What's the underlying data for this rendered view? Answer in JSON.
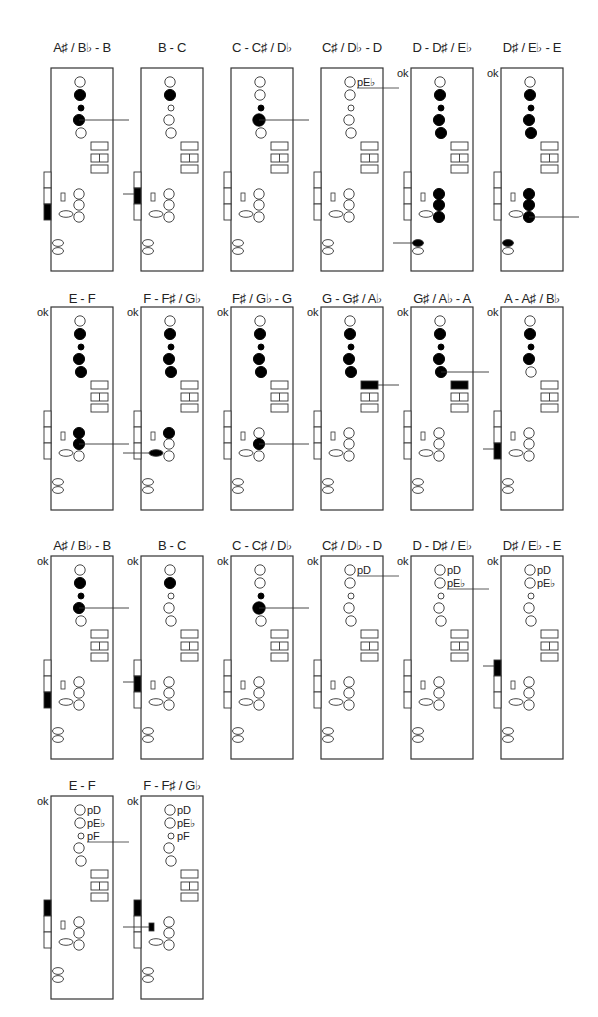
{
  "figure": {
    "ok_label": "ok",
    "rows": [
      {
        "title_y": 40,
        "box_y": 68
      },
      {
        "title_y": 291,
        "box_y": 307
      },
      {
        "title_y": 538,
        "box_y": 556
      },
      {
        "title_y": 778,
        "box_y": 796
      }
    ],
    "columns_x": [
      51,
      141,
      231,
      321,
      411,
      501
    ],
    "panels": [
      {
        "row": 0,
        "col": 0,
        "title": "A♯ / B♭ - B",
        "ok": false,
        "upper": [
          "open",
          "filled",
          "filled-small",
          "filled",
          "open"
        ],
        "upper_line": 3,
        "pads": [
          "open",
          "split",
          "open"
        ],
        "pad_line": -1,
        "side": [
          "open",
          "open",
          "filled"
        ],
        "side_line": -1,
        "lower": [
          "open",
          "open",
          "open"
        ],
        "lower_line": -1,
        "small_key": "open",
        "oval": "open",
        "bottom": [
          "open",
          "open"
        ],
        "bottom_line": -1,
        "labels": []
      },
      {
        "row": 0,
        "col": 1,
        "title": "B - C",
        "ok": false,
        "upper": [
          "open",
          "filled",
          "open-small",
          "open",
          "open"
        ],
        "upper_line": -1,
        "pads": [
          "open",
          "split",
          "open"
        ],
        "pad_line": -1,
        "side": [
          "open",
          "filled",
          "open"
        ],
        "side_line": 1,
        "lower": [
          "open",
          "open",
          "open"
        ],
        "lower_line": -1,
        "small_key": "open",
        "oval": "open",
        "bottom": [
          "open",
          "open"
        ],
        "bottom_line": -1,
        "labels": []
      },
      {
        "row": 0,
        "col": 2,
        "title": "C - C♯ / D♭",
        "ok": false,
        "upper": [
          "open",
          "open",
          "filled-small",
          "filled-big",
          "open"
        ],
        "upper_line": 3,
        "pads": [
          "open",
          "split",
          "open"
        ],
        "pad_line": -1,
        "side": [
          "open",
          "open",
          "open"
        ],
        "side_line": -1,
        "lower": [
          "open",
          "open",
          "open"
        ],
        "lower_line": -1,
        "small_key": "open",
        "oval": "open",
        "bottom": [
          "open",
          "open"
        ],
        "bottom_line": -1,
        "labels": []
      },
      {
        "row": 0,
        "col": 3,
        "title": "C♯ / D♭ - D",
        "ok": false,
        "upper": [
          "open",
          "open",
          "open-small",
          "open",
          "open"
        ],
        "upper_line": -1,
        "pads": [
          "open",
          "split",
          "open"
        ],
        "pad_line": -1,
        "side": [
          "open",
          "open",
          "open"
        ],
        "side_line": -1,
        "lower": [
          "open",
          "open",
          "open"
        ],
        "lower_line": -1,
        "small_key": "open",
        "oval": "open",
        "bottom": [
          "open",
          "open"
        ],
        "bottom_line": -1,
        "labels": [
          {
            "text": "pE♭",
            "hole": 0,
            "line": true
          }
        ]
      },
      {
        "row": 0,
        "col": 4,
        "title": "D - D♯ / E♭",
        "ok": true,
        "upper": [
          "open",
          "filled",
          "filled-small",
          "filled",
          "filled"
        ],
        "upper_line": -1,
        "pads": [
          "open",
          "split",
          "open"
        ],
        "pad_line": -1,
        "side": [
          "open",
          "open",
          "open"
        ],
        "side_line": -1,
        "lower": [
          "filled",
          "filled",
          "filled"
        ],
        "lower_line": -1,
        "small_key": "open",
        "oval": "open",
        "bottom": [
          "filled",
          "open"
        ],
        "bottom_line": 0,
        "labels": []
      },
      {
        "row": 0,
        "col": 5,
        "title": "D♯ / E♭ - E",
        "ok": true,
        "upper": [
          "open",
          "filled",
          "filled-small",
          "filled",
          "filled"
        ],
        "upper_line": -1,
        "pads": [
          "open",
          "split",
          "open"
        ],
        "pad_line": -1,
        "side": [
          "open",
          "open",
          "open"
        ],
        "side_line": -1,
        "lower": [
          "filled",
          "filled",
          "filled"
        ],
        "lower_line": 2,
        "small_key": "open",
        "oval": "open",
        "bottom": [
          "filled",
          "open"
        ],
        "bottom_line": -1,
        "labels": []
      },
      {
        "row": 1,
        "col": 0,
        "title": "E - F",
        "ok": true,
        "upper": [
          "open",
          "filled",
          "filled-small",
          "filled",
          "filled"
        ],
        "upper_line": -1,
        "pads": [
          "open",
          "split",
          "open"
        ],
        "pad_line": -1,
        "side": [
          "open",
          "open",
          "open"
        ],
        "side_line": -1,
        "lower": [
          "filled",
          "filled",
          "open"
        ],
        "lower_line": 1,
        "small_key": "open",
        "oval": "open",
        "bottom": [
          "open",
          "open"
        ],
        "bottom_line": -1,
        "labels": []
      },
      {
        "row": 1,
        "col": 1,
        "title": "F - F♯ / G♭",
        "ok": true,
        "upper": [
          "open",
          "filled",
          "filled-small",
          "filled",
          "filled"
        ],
        "upper_line": -1,
        "pads": [
          "open",
          "split",
          "open"
        ],
        "pad_line": -1,
        "side": [
          "open",
          "open",
          "open"
        ],
        "side_line": -1,
        "lower": [
          "filled",
          "open",
          "open"
        ],
        "lower_line": -1,
        "small_key": "open",
        "oval": "filled",
        "oval_line": true,
        "bottom": [
          "open",
          "open"
        ],
        "bottom_line": -1,
        "labels": []
      },
      {
        "row": 1,
        "col": 2,
        "title": "F♯ / G♭ - G",
        "ok": true,
        "upper": [
          "open",
          "filled",
          "filled-small",
          "filled",
          "filled"
        ],
        "upper_line": -1,
        "pads": [
          "open",
          "split",
          "open"
        ],
        "pad_line": -1,
        "side": [
          "open",
          "open",
          "open"
        ],
        "side_line": -1,
        "lower": [
          "open",
          "filled",
          "open"
        ],
        "lower_line": 1,
        "small_key": "open",
        "oval": "open",
        "bottom": [
          "open",
          "open"
        ],
        "bottom_line": -1,
        "labels": []
      },
      {
        "row": 1,
        "col": 3,
        "title": "G - G♯ / A♭",
        "ok": true,
        "upper": [
          "open",
          "filled",
          "filled-small",
          "filled",
          "filled"
        ],
        "upper_line": -1,
        "pads": [
          "filled",
          "split",
          "open"
        ],
        "pad_line": 0,
        "side": [
          "open",
          "open",
          "open"
        ],
        "side_line": -1,
        "lower": [
          "open",
          "open",
          "open"
        ],
        "lower_line": -1,
        "small_key": "open",
        "oval": "open",
        "bottom": [
          "open",
          "open"
        ],
        "bottom_line": -1,
        "labels": []
      },
      {
        "row": 1,
        "col": 4,
        "title": "G♯ / A♭ - A",
        "ok": true,
        "upper": [
          "open",
          "filled",
          "filled-small",
          "filled",
          "filled"
        ],
        "upper_line": 4,
        "pads": [
          "filled",
          "split",
          "open"
        ],
        "pad_line": -1,
        "side": [
          "open",
          "open",
          "open"
        ],
        "side_line": -1,
        "lower": [
          "open",
          "open",
          "open"
        ],
        "lower_line": -1,
        "small_key": "open",
        "oval": "open",
        "bottom": [
          "open",
          "open"
        ],
        "bottom_line": -1,
        "labels": []
      },
      {
        "row": 1,
        "col": 5,
        "title": "A - A♯ / B♭",
        "ok": true,
        "upper": [
          "open",
          "filled",
          "filled-small",
          "filled",
          "open"
        ],
        "upper_line": -1,
        "pads": [
          "open",
          "split",
          "open"
        ],
        "pad_line": -1,
        "side": [
          "open",
          "open",
          "filled"
        ],
        "side_line": 2,
        "lower": [
          "open",
          "open",
          "open"
        ],
        "lower_line": -1,
        "small_key": "open",
        "oval": "open",
        "bottom": [
          "open",
          "open"
        ],
        "bottom_line": -1,
        "labels": []
      },
      {
        "row": 2,
        "col": 0,
        "title": "A♯ / B♭ - B",
        "ok": true,
        "upper": [
          "open",
          "filled",
          "filled-small",
          "filled",
          "open"
        ],
        "upper_line": 3,
        "pads": [
          "open",
          "split",
          "open"
        ],
        "pad_line": -1,
        "side": [
          "open",
          "open",
          "filled"
        ],
        "side_line": -1,
        "lower": [
          "open",
          "open",
          "open"
        ],
        "lower_line": -1,
        "small_key": "open",
        "oval": "open",
        "bottom": [
          "open",
          "open"
        ],
        "bottom_line": -1,
        "labels": []
      },
      {
        "row": 2,
        "col": 1,
        "title": "B - C",
        "ok": true,
        "upper": [
          "open",
          "filled",
          "open-small",
          "open",
          "open"
        ],
        "upper_line": -1,
        "pads": [
          "open",
          "split",
          "open"
        ],
        "pad_line": -1,
        "side": [
          "open",
          "filled",
          "open"
        ],
        "side_line": 1,
        "lower": [
          "open",
          "open",
          "open"
        ],
        "lower_line": -1,
        "small_key": "open",
        "oval": "open",
        "bottom": [
          "open",
          "open"
        ],
        "bottom_line": -1,
        "labels": []
      },
      {
        "row": 2,
        "col": 2,
        "title": "C - C♯ / D♭",
        "ok": true,
        "upper": [
          "open",
          "open",
          "filled-small",
          "filled-big",
          "open"
        ],
        "upper_line": 3,
        "pads": [
          "open",
          "split",
          "open"
        ],
        "pad_line": -1,
        "side": [
          "open",
          "open",
          "open"
        ],
        "side_line": -1,
        "lower": [
          "open",
          "open",
          "open"
        ],
        "lower_line": -1,
        "small_key": "open",
        "oval": "open",
        "bottom": [
          "open",
          "open"
        ],
        "bottom_line": -1,
        "labels": []
      },
      {
        "row": 2,
        "col": 3,
        "title": "C♯ / D♭ - D",
        "ok": true,
        "upper": [
          "open",
          "open",
          "open-small",
          "open",
          "open"
        ],
        "upper_line": -1,
        "pads": [
          "open",
          "split",
          "open"
        ],
        "pad_line": -1,
        "side": [
          "open",
          "open",
          "open"
        ],
        "side_line": -1,
        "lower": [
          "open",
          "open",
          "open"
        ],
        "lower_line": -1,
        "small_key": "open",
        "oval": "open",
        "bottom": [
          "open",
          "open"
        ],
        "bottom_line": -1,
        "labels": [
          {
            "text": "pD",
            "hole": 0,
            "line": true
          }
        ]
      },
      {
        "row": 2,
        "col": 4,
        "title": "D - D♯ / E♭",
        "ok": true,
        "upper": [
          "open",
          "open",
          "open-small",
          "open",
          "open"
        ],
        "upper_line": -1,
        "pads": [
          "open",
          "split",
          "open"
        ],
        "pad_line": -1,
        "side": [
          "open",
          "open",
          "open"
        ],
        "side_line": -1,
        "lower": [
          "open",
          "open",
          "open"
        ],
        "lower_line": -1,
        "small_key": "open",
        "oval": "open",
        "bottom": [
          "open",
          "open"
        ],
        "bottom_line": -1,
        "labels": [
          {
            "text": "pD",
            "hole": 0,
            "line": false
          },
          {
            "text": "pE♭",
            "hole": 1,
            "line": true
          }
        ]
      },
      {
        "row": 2,
        "col": 5,
        "title": "D♯ / E♭ - E",
        "ok": true,
        "upper": [
          "open",
          "open",
          "open-small",
          "open",
          "open"
        ],
        "upper_line": -1,
        "pads": [
          "open",
          "split",
          "open"
        ],
        "pad_line": -1,
        "side": [
          "filled",
          "open",
          "open"
        ],
        "side_line": 0,
        "lower": [
          "open",
          "open",
          "open"
        ],
        "lower_line": -1,
        "small_key": "open",
        "oval": "open",
        "bottom": [
          "open",
          "open"
        ],
        "bottom_line": -1,
        "labels": [
          {
            "text": "pD",
            "hole": 0,
            "line": false
          },
          {
            "text": "pE♭",
            "hole": 1,
            "line": false
          }
        ]
      },
      {
        "row": 3,
        "col": 0,
        "title": "E - F",
        "ok": true,
        "upper": [
          "open",
          "open",
          "open-small",
          "open",
          "open"
        ],
        "upper_line": -1,
        "pads": [
          "open",
          "split",
          "open"
        ],
        "pad_line": -1,
        "side": [
          "filled",
          "open",
          "open"
        ],
        "side_line": -1,
        "lower": [
          "open",
          "open",
          "open"
        ],
        "lower_line": -1,
        "small_key": "open",
        "oval": "open",
        "bottom": [
          "open",
          "open"
        ],
        "bottom_line": -1,
        "labels": [
          {
            "text": "pD",
            "hole": 0,
            "line": false
          },
          {
            "text": "pE♭",
            "hole": 1,
            "line": false
          },
          {
            "text": "pF",
            "hole": 2,
            "line": true
          }
        ]
      },
      {
        "row": 3,
        "col": 1,
        "title": "F - F♯ / G♭",
        "ok": true,
        "upper": [
          "open",
          "open",
          "open-small",
          "open",
          "open"
        ],
        "upper_line": -1,
        "pads": [
          "open",
          "split",
          "open"
        ],
        "pad_line": -1,
        "side": [
          "filled",
          "open",
          "open"
        ],
        "side_line": -1,
        "lower": [
          "open",
          "open",
          "open"
        ],
        "lower_line": -1,
        "small_key": "filled",
        "small_key_line": true,
        "oval": "open",
        "bottom": [
          "open",
          "open"
        ],
        "bottom_line": -1,
        "labels": [
          {
            "text": "pD",
            "hole": 0,
            "line": false
          },
          {
            "text": "pE♭",
            "hole": 1,
            "line": false
          },
          {
            "text": "pF",
            "hole": 2,
            "line": false
          }
        ]
      }
    ]
  }
}
